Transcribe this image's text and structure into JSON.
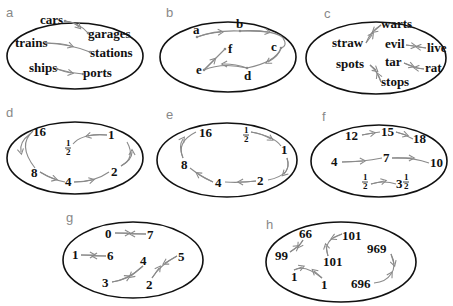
{
  "figure": {
    "panels": [
      {
        "id": "a",
        "letter": "a",
        "pairs": [
          {
            "from": "cars",
            "to": "garages"
          },
          {
            "from": "trains",
            "to": "stations"
          },
          {
            "from": "ships",
            "to": "ports"
          }
        ]
      },
      {
        "id": "b",
        "letter": "b",
        "nodes": [
          "a",
          "b",
          "c",
          "d",
          "e",
          "f"
        ],
        "path": "a → b → c → d → e → f"
      },
      {
        "id": "c",
        "letter": "c",
        "pairs": [
          {
            "a": "straw",
            "b": "warts"
          },
          {
            "a": "evil",
            "b": "live"
          },
          {
            "a": "spots",
            "b": "stops"
          },
          {
            "a": "tar",
            "b": "rat"
          }
        ]
      },
      {
        "id": "d",
        "letter": "d",
        "nodes": [
          "16",
          "8",
          "4",
          "2",
          "1",
          "½"
        ],
        "path": "16 → 8 → 4 → 2 → 1 → ½"
      },
      {
        "id": "e",
        "letter": "e",
        "nodes": [
          "½",
          "1",
          "2",
          "4",
          "8",
          "16"
        ],
        "path": "½ → 1 → 2 → 4 → 8 → 16"
      },
      {
        "id": "f",
        "letter": "f",
        "chains": [
          [
            "12",
            "15",
            "18"
          ],
          [
            "4",
            "7",
            "10"
          ],
          [
            "½",
            "3½"
          ]
        ]
      },
      {
        "id": "g",
        "letter": "g",
        "pairs": [
          {
            "a": "0",
            "b": "7"
          },
          {
            "a": "1",
            "b": "6"
          },
          {
            "a": "3",
            "b": "4"
          },
          {
            "a": "2",
            "b": "5"
          }
        ]
      },
      {
        "id": "h",
        "letter": "h",
        "pairs": [
          {
            "a": "99",
            "b": "66"
          },
          {
            "a": "101",
            "b": "101"
          },
          {
            "a": "969",
            "b": "696"
          },
          {
            "a": "1",
            "b": "1"
          }
        ]
      }
    ]
  },
  "labels": {
    "a": {
      "letter": "a",
      "cars": "cars",
      "garages": "garages",
      "trains": "trains",
      "stations": "stations",
      "ships": "ships",
      "ports": "ports"
    },
    "b": {
      "letter": "b",
      "a": "a",
      "b": "b",
      "c": "c",
      "d": "d",
      "e": "e",
      "f": "f"
    },
    "c": {
      "letter": "c",
      "straw": "straw",
      "warts": "warts",
      "evil": "evil",
      "live": "live",
      "spots": "spots",
      "stops": "stops",
      "tar": "tar",
      "rat": "rat"
    },
    "d": {
      "letter": "d",
      "n16": "16",
      "n8": "8",
      "n4": "4",
      "n2": "2",
      "n1": "1",
      "half_num": "1",
      "half_den": "2"
    },
    "e": {
      "letter": "e",
      "n16": "16",
      "n8": "8",
      "n4": "4",
      "n2": "2",
      "n1": "1",
      "half_num": "1",
      "half_den": "2"
    },
    "f": {
      "letter": "f",
      "n12": "12",
      "n15": "15",
      "n18": "18",
      "n4": "4",
      "n7": "7",
      "n10": "10",
      "half_num": "1",
      "half_den": "2",
      "three": "3"
    },
    "g": {
      "letter": "g",
      "n0": "0",
      "n7": "7",
      "n1": "1",
      "n6": "6",
      "n3": "3",
      "n4": "4",
      "n2": "2",
      "n5": "5"
    },
    "h": {
      "letter": "h",
      "n66": "66",
      "n99": "99",
      "n101a": "101",
      "n101b": "101",
      "n969": "969",
      "n696": "696",
      "n1a": "1",
      "n1b": "1"
    }
  },
  "colors": {
    "ellipse": "#111111",
    "arrow": "#8a8a8a",
    "text": "#111111",
    "panel_letter": "#888888"
  }
}
